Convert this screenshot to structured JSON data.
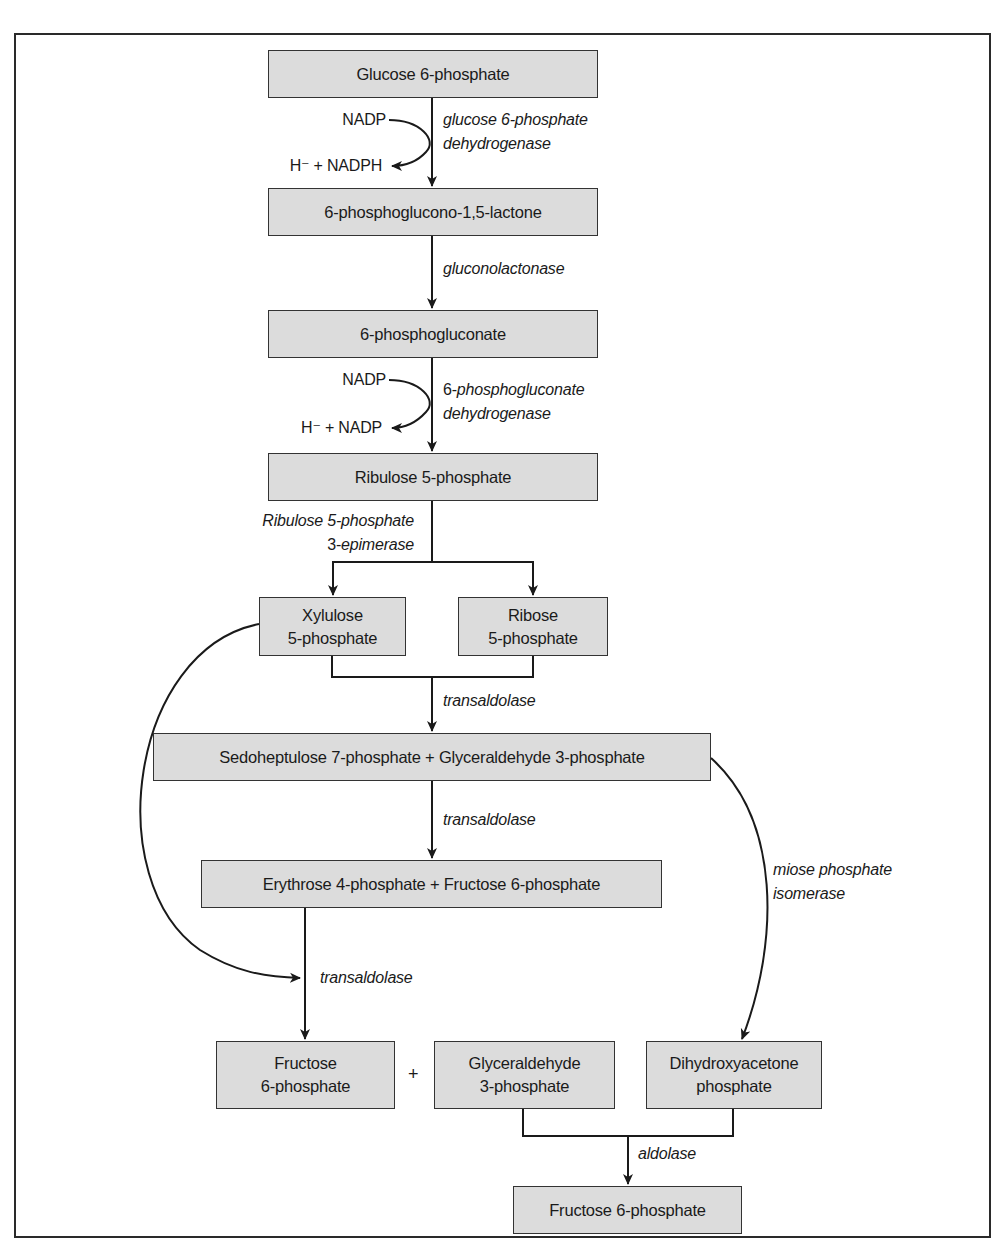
{
  "diagram": {
    "nodes": {
      "g6p": {
        "label": "Glucose 6-phosphate"
      },
      "lactone": {
        "label": "6-phosphoglucono-1,5-lactone"
      },
      "pg": {
        "label": "6-phosphogluconate"
      },
      "ru5p": {
        "label": "Ribulose 5-phosphate"
      },
      "xu5p": {
        "line1": "Xylulose",
        "line2": "5-phosphate"
      },
      "r5p": {
        "line1": "Ribose",
        "line2": "5-phosphate"
      },
      "s7p_g3p": {
        "label": "Sedoheptulose 7-phosphate + Glyceraldehyde 3-phosphate"
      },
      "e4p_f6p": {
        "label": "Erythrose 4-phosphate + Fructose 6-phosphate"
      },
      "f6p_a": {
        "line1": "Fructose",
        "line2": "6-phosphate"
      },
      "g3p": {
        "line1": "Glyceraldehyde",
        "line2": "3-phosphate"
      },
      "dhap": {
        "line1": "Dihydroxyacetone",
        "line2": "phosphate"
      },
      "f6p_b": {
        "label": "Fructose 6-phosphate"
      }
    },
    "plus_sign": "+",
    "cofactors": {
      "step1_in": "NADP",
      "step1_out": "H⁻ + NADPH",
      "step3_in": "NADP",
      "step3_out": "H⁻ + NADP"
    },
    "enzymes": {
      "g6pd_line1": "glucose 6-phosphate",
      "g6pd_line2": "dehydrogenase",
      "gluconolactonase": "gluconolactonase",
      "pgd_prefix": "6-",
      "pgd_line1": "phosphogluconate",
      "pgd_line2": "dehydrogenase",
      "rpe_line1": "Ribulose 5-phosphate",
      "rpe_prefix": "3-",
      "rpe_line2": "epimerase",
      "transaldolase_1": "transaldolase",
      "transaldolase_2": "transaldolase",
      "transaldolase_3": "transaldolase",
      "tpi_line1": "miose phosphate",
      "tpi_line2": "isomerase",
      "aldolase": "aldolase"
    },
    "colors": {
      "box_fill": "#dcdcdc",
      "box_border": "#333333",
      "line": "#1a1a1a",
      "background": "#ffffff"
    }
  }
}
